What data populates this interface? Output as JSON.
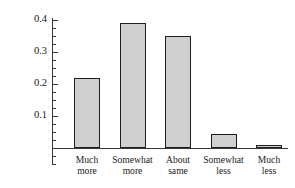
{
  "chart_data": {
    "type": "bar",
    "title": "",
    "xlabel": "",
    "ylabel": "Proportion responding",
    "categories": [
      "Much more",
      "Somewhat more",
      "About same",
      "Somewhat less",
      "Much less"
    ],
    "category_lines": [
      [
        "Much",
        "more"
      ],
      [
        "Somewhat",
        "more"
      ],
      [
        "About",
        "same"
      ],
      [
        "Somewhat",
        "less"
      ],
      [
        "Much",
        "less"
      ]
    ],
    "values": [
      0.22,
      0.39,
      0.35,
      0.045,
      0.005
    ],
    "ylim": [
      0,
      0.42
    ],
    "ytick_labels": [
      "0.1",
      "0.2",
      "0.3",
      "0.4"
    ],
    "ytick_values": [
      0.1,
      0.2,
      0.3,
      0.4
    ],
    "yminor_step": 0.025,
    "grid": false,
    "legend": false,
    "bar_fill_color": "#cfcfcf",
    "bar_edge_color": "#1f1f1f",
    "axis_color": "#3a3a3a",
    "background_color": "#ffffff"
  }
}
